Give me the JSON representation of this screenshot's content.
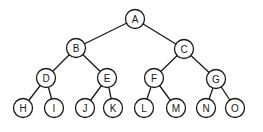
{
  "diagram": {
    "type": "binary-tree",
    "node_radius": 9.5,
    "nodes": [
      {
        "id": "A",
        "label": "A",
        "x": 135,
        "y": 19
      },
      {
        "id": "B",
        "label": "B",
        "x": 76,
        "y": 48
      },
      {
        "id": "C",
        "label": "C",
        "x": 184,
        "y": 49
      },
      {
        "id": "D",
        "label": "D",
        "x": 46,
        "y": 78
      },
      {
        "id": "E",
        "label": "E",
        "x": 107,
        "y": 78
      },
      {
        "id": "F",
        "label": "F",
        "x": 154,
        "y": 78
      },
      {
        "id": "G",
        "label": "G",
        "x": 216,
        "y": 79
      },
      {
        "id": "H",
        "label": "H",
        "x": 23,
        "y": 108
      },
      {
        "id": "I",
        "label": "I",
        "x": 54,
        "y": 108
      },
      {
        "id": "J",
        "label": "J",
        "x": 85,
        "y": 108
      },
      {
        "id": "K",
        "label": "K",
        "x": 113,
        "y": 108
      },
      {
        "id": "L",
        "label": "L",
        "x": 144,
        "y": 108
      },
      {
        "id": "M",
        "label": "M",
        "x": 176,
        "y": 108
      },
      {
        "id": "N",
        "label": "N",
        "x": 206,
        "y": 108
      },
      {
        "id": "O",
        "label": "O",
        "x": 235,
        "y": 108
      }
    ],
    "edges": [
      [
        "A",
        "B"
      ],
      [
        "A",
        "C"
      ],
      [
        "B",
        "D"
      ],
      [
        "B",
        "E"
      ],
      [
        "C",
        "F"
      ],
      [
        "C",
        "G"
      ],
      [
        "D",
        "H"
      ],
      [
        "D",
        "I"
      ],
      [
        "E",
        "J"
      ],
      [
        "E",
        "K"
      ],
      [
        "F",
        "L"
      ],
      [
        "F",
        "M"
      ],
      [
        "G",
        "N"
      ],
      [
        "G",
        "O"
      ]
    ]
  }
}
